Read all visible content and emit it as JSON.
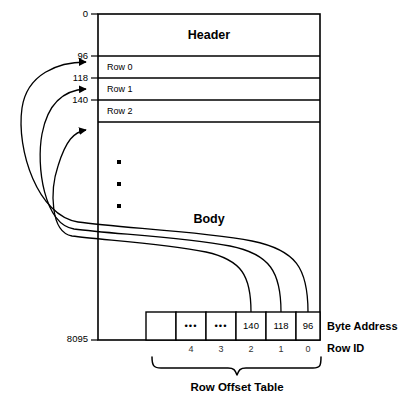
{
  "diagram": {
    "page_box": {
      "header_label": "Header",
      "body_label": "Body",
      "vertical_ellipsis": "▪"
    },
    "byte_offset_ticks": [
      {
        "value": "0"
      },
      {
        "value": "96"
      },
      {
        "value": "118"
      },
      {
        "value": "140"
      },
      {
        "value": "8095"
      }
    ],
    "rows": [
      {
        "label": "Row 0"
      },
      {
        "label": "Row 1"
      },
      {
        "label": "Row 2"
      }
    ],
    "row_offset_table": {
      "cells": [
        {
          "value": "",
          "row_id": ""
        },
        {
          "value": "•••",
          "row_id": "4"
        },
        {
          "value": "•••",
          "row_id": "3"
        },
        {
          "value": "140",
          "row_id": "2"
        },
        {
          "value": "118",
          "row_id": "1"
        },
        {
          "value": "96",
          "row_id": "0"
        }
      ],
      "brace_label": "Row Offset Table"
    },
    "captions": {
      "byte_address": "Byte Address",
      "row_id": "Row ID"
    },
    "colors": {
      "stroke": "#000000",
      "background": "#ffffff",
      "muted_text": "#333333"
    }
  }
}
